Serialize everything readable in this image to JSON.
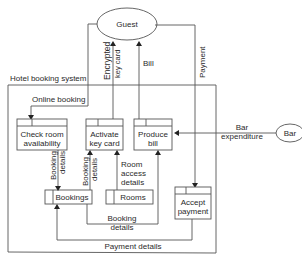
{
  "diagram": {
    "type": "data-flow-diagram",
    "system_boundary": {
      "label": "Hotel booking system"
    },
    "external_entities": [
      {
        "id": "guest",
        "label": "Guest"
      },
      {
        "id": "bar",
        "label": "Bar"
      }
    ],
    "processes": [
      {
        "id": "check",
        "line1": "Check room",
        "line2": "availability"
      },
      {
        "id": "activate",
        "line1": "Activate",
        "line2": "key card"
      },
      {
        "id": "produce",
        "line1": "Produce",
        "line2": "bill"
      },
      {
        "id": "accept",
        "line1": "Accept",
        "line2": "payment"
      }
    ],
    "data_stores": [
      {
        "id": "bookings",
        "label": "Bookings"
      },
      {
        "id": "rooms",
        "label": "Rooms"
      }
    ],
    "flows": {
      "online_booking": "Online booking",
      "encrypted_line1": "Encrypted",
      "encrypted_line2": "key card",
      "bill": "Bill",
      "payment": "Payment",
      "bar_line1": "Bar",
      "bar_line2": "expenditure",
      "booking_details_a1": "Booking",
      "booking_details_a2": "details",
      "booking_details_b1": "Booking",
      "booking_details_b2": "details",
      "room_access_1": "Room",
      "room_access_2": "access",
      "room_access_3": "details",
      "booking_details_c1": "Booking",
      "booking_details_c2": "details",
      "payment_details": "Payment details"
    }
  }
}
